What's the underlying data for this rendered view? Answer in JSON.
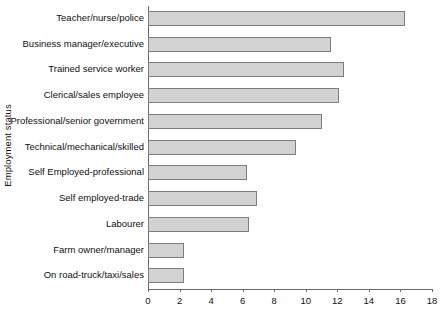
{
  "chart_data": {
    "type": "bar",
    "orientation": "horizontal",
    "title": "",
    "xlabel": "",
    "ylabel": "Employment status",
    "xlim": [
      0,
      18
    ],
    "xticks": [
      0,
      2,
      4,
      6,
      8,
      10,
      12,
      14,
      16,
      18
    ],
    "grid": false,
    "legend": null,
    "bar_color": "#d2d2d2",
    "bar_border_color": "#7d7d7d",
    "axis_color": "#6b6b6b",
    "categories": [
      "Teacher/nurse/police",
      "Business manager/executive",
      "Trained service worker",
      "Clerical/sales employee",
      "Professional/senior government",
      "Technical/mechanical/skilled",
      "Self Employed-professional",
      "Self employed-trade",
      "Labourer",
      "Farm owner/manager",
      "On road-truck/taxi/sales"
    ],
    "values": [
      16.3,
      11.6,
      12.4,
      12.1,
      11.0,
      9.4,
      6.3,
      6.9,
      6.4,
      2.3,
      2.3
    ]
  },
  "caption": {
    "bottom_cutoff_text": ""
  }
}
